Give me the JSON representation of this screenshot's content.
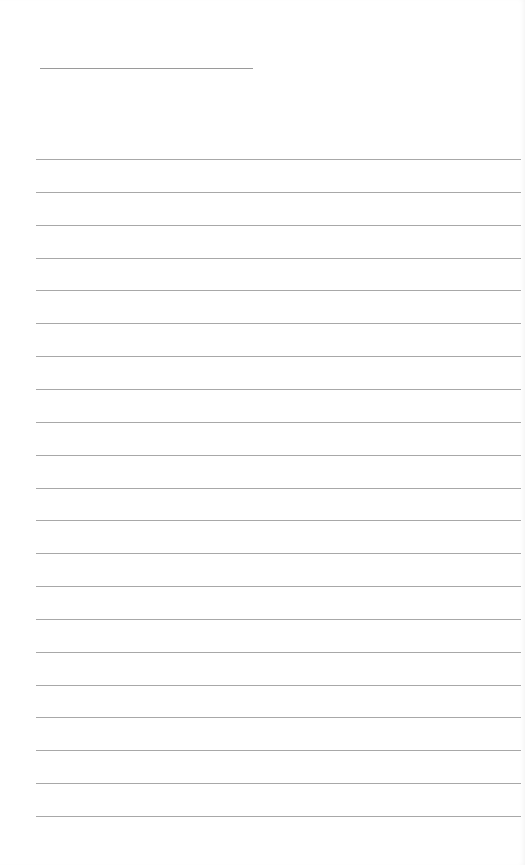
{
  "sheet": {
    "type": "lined-paper",
    "background_color": "#ffffff",
    "line_color": "#a8a8a8",
    "header_line": {
      "top": 68,
      "left": 40,
      "width": 213
    },
    "ruled_lines": {
      "count": 21,
      "first_top": 159,
      "spacing": 32.85
    }
  }
}
